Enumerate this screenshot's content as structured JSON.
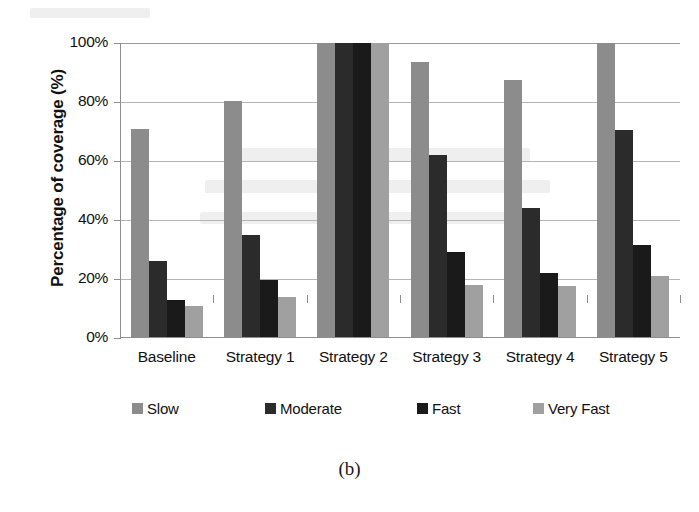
{
  "figure": {
    "caption": "(b)",
    "ytitle": "Percentage of coverage (%)"
  },
  "legend": {
    "items": [
      {
        "label": "Slow",
        "color": "#8c8c8c"
      },
      {
        "label": "Moderate",
        "color": "#2b2b2b"
      },
      {
        "label": "Fast",
        "color": "#1a1a1a"
      },
      {
        "label": "Very Fast",
        "color": "#a0a0a0"
      }
    ]
  },
  "chart_data": {
    "type": "bar",
    "title": "",
    "xlabel": "",
    "ylabel": "Percentage of coverage (%)",
    "ylim": [
      0,
      100
    ],
    "yticks": [
      0,
      20,
      40,
      60,
      80,
      100
    ],
    "ytick_labels": [
      "0%",
      "20%",
      "40%",
      "60%",
      "80%",
      "100%"
    ],
    "grid": true,
    "legend_position": "bottom",
    "categories": [
      "Baseline",
      "Strategy 1",
      "Strategy 2",
      "Strategy 3",
      "Strategy 4",
      "Strategy 5"
    ],
    "series": [
      {
        "name": "Slow",
        "color": "#8c8c8c",
        "values": [
          71,
          80.5,
          100,
          93.5,
          87.5,
          100
        ]
      },
      {
        "name": "Moderate",
        "color": "#2b2b2b",
        "values": [
          26,
          35,
          100,
          62,
          44,
          70.5
        ]
      },
      {
        "name": "Fast",
        "color": "#1a1a1a",
        "values": [
          13,
          19.5,
          100,
          29,
          22,
          31.5
        ]
      },
      {
        "name": "Very Fast",
        "color": "#a0a0a0",
        "values": [
          11,
          14,
          100,
          18,
          17.5,
          21
        ]
      }
    ]
  }
}
